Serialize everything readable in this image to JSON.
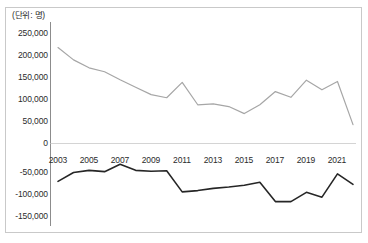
{
  "chart_data": {
    "type": "line",
    "title": "",
    "subtitle": "",
    "unit_note": "(단위: 명)",
    "xlabel": "",
    "ylabel": "",
    "ylim": [
      -150000,
      250000
    ],
    "y_ticks": [
      250000,
      200000,
      150000,
      100000,
      50000,
      0,
      -50000,
      -100000,
      -150000
    ],
    "y_tick_labels": [
      "250,000",
      "200,000",
      "150,000",
      "100,000",
      "50,000",
      "0",
      "-50,000",
      "-100,000",
      "-150,000"
    ],
    "x_tick_labels": [
      "2003",
      "2005",
      "2007",
      "2009",
      "2011",
      "2013",
      "2015",
      "2017",
      "2019",
      "2021"
    ],
    "x": [
      2003,
      2004,
      2005,
      2006,
      2007,
      2008,
      2009,
      2010,
      2011,
      2012,
      2013,
      2014,
      2015,
      2016,
      2017,
      2018,
      2019,
      2020,
      2021,
      2022
    ],
    "grid": false,
    "legend": "none",
    "series": [
      {
        "name": "상단 회색 선",
        "color": "#a6a6a6",
        "values": [
          218000,
          190000,
          172000,
          163000,
          145000,
          128000,
          111000,
          104000,
          139000,
          88000,
          90000,
          84000,
          68000,
          88000,
          118000,
          105000,
          144000,
          122000,
          141000,
          43000
        ]
      },
      {
        "name": "하단 검정 선",
        "color": "#262626",
        "values": [
          -86000,
          -66000,
          -61000,
          -64000,
          -47000,
          -61000,
          -63000,
          -62000,
          -110000,
          -107000,
          -102000,
          -99000,
          -95000,
          -88000,
          -132000,
          -132000,
          -111000,
          -122000,
          -69000,
          -93000
        ]
      }
    ]
  },
  "axis": {
    "y_label_0": "250,000",
    "y_label_1": "200,000",
    "y_label_2": "150,000",
    "y_label_3": "100,000",
    "y_label_4": "50,000",
    "y_label_5": "0",
    "y_label_6": "-50,000",
    "y_label_7": "-100,000",
    "y_label_8": "-150,000",
    "x_label_0": "2003",
    "x_label_1": "2005",
    "x_label_2": "2007",
    "x_label_3": "2009",
    "x_label_4": "2011",
    "x_label_5": "2013",
    "x_label_6": "2015",
    "x_label_7": "2017",
    "x_label_8": "2019",
    "x_label_9": "2021"
  },
  "colors": {
    "series_upper": "#a6a6a6",
    "series_lower": "#262626",
    "axis_line": "#8c8c8c",
    "frame": "#c9c9c9",
    "text": "#2b2b2b"
  }
}
